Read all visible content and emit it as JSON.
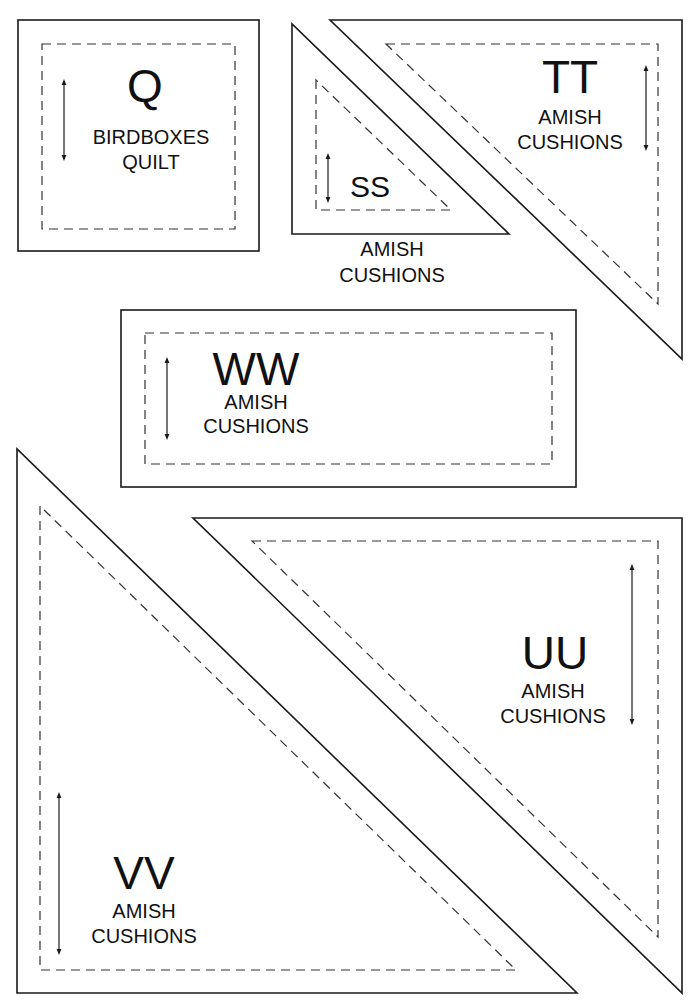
{
  "page": {
    "type": "quilt template sheet",
    "background": "#ffffff",
    "line_color": "#1a1a1a"
  },
  "pieces": {
    "q": {
      "letter": "Q",
      "shape": "square",
      "line1": "BIRDBOXES",
      "line2": "QUILT",
      "grain_arrow": "vertical"
    },
    "ss": {
      "letter": "SS",
      "shape": "triangle",
      "line1": "AMISH",
      "line2": "CUSHIONS",
      "grain_arrow": "vertical"
    },
    "tt": {
      "letter": "TT",
      "shape": "triangle",
      "line1": "AMISH",
      "line2": "CUSHIONS",
      "grain_arrow": "vertical"
    },
    "ww": {
      "letter": "WW",
      "shape": "rectangle",
      "line1": "AMISH",
      "line2": "CUSHIONS",
      "grain_arrow": "vertical"
    },
    "uu": {
      "letter": "UU",
      "shape": "triangle",
      "line1": "AMISH",
      "line2": "CUSHIONS",
      "grain_arrow": "vertical"
    },
    "vv": {
      "letter": "VV",
      "shape": "triangle",
      "line1": "AMISH",
      "line2": "CUSHIONS",
      "grain_arrow": "vertical"
    }
  }
}
